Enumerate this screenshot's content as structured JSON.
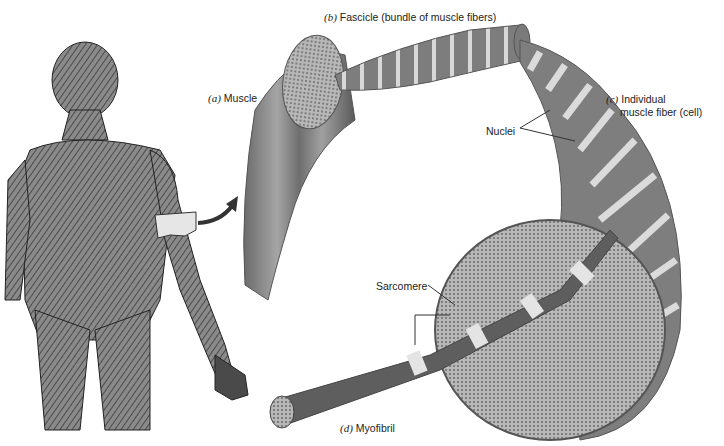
{
  "figure": {
    "labels": {
      "a": {
        "letter": "(a)",
        "text": "Muscle"
      },
      "b": {
        "letter": "(b)",
        "text": "Fascicle (bundle of muscle fibers)"
      },
      "c": {
        "letter": "(c)",
        "text_line1": "Individual",
        "text_line2": "muscle fiber (cell)"
      },
      "d": {
        "letter": "(d)",
        "text": "Myofibril"
      },
      "nuclei": "Nuclei",
      "sarcomere": "Sarcomere"
    },
    "colors": {
      "body": "#5a5a5a",
      "tissue": "#7a7a7a",
      "tissue_dark": "#555555",
      "band_light": "#e8e8e8",
      "cross_section": "#a9a9a9",
      "line": "#333333"
    }
  }
}
